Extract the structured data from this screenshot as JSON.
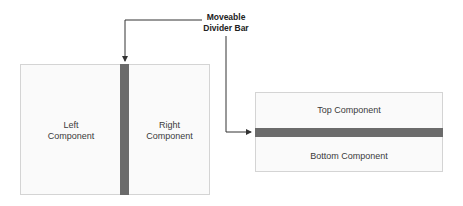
{
  "callout": {
    "line1": "Moveable",
    "line2": "Divider Bar"
  },
  "vertical_split": {
    "left_label_1": "Left",
    "left_label_2": "Component",
    "right_label_1": "Right",
    "right_label_2": "Component"
  },
  "horizontal_split": {
    "top_label": "Top Component",
    "bottom_label": "Bottom Component"
  },
  "colors": {
    "divider": "#6b6b6b",
    "panel_bg": "#fafafa",
    "panel_border": "#d4d4d4",
    "arrow": "#333333"
  }
}
